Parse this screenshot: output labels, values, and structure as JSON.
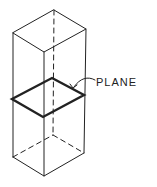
{
  "diagram": {
    "label": "PLANE",
    "colors": {
      "line": "#222222",
      "background": "#ffffff"
    },
    "prism": {
      "top_face": [
        [
          54,
          10
        ],
        [
          86,
          29
        ],
        [
          44,
          52
        ],
        [
          13,
          33
        ]
      ],
      "bottom_face": [
        [
          53,
          135
        ],
        [
          84,
          153
        ],
        [
          44,
          176
        ],
        [
          13,
          157
        ]
      ],
      "hidden_edges": "dashed"
    },
    "plane": [
      [
        52,
        78
      ],
      [
        84,
        95
      ],
      [
        43,
        117
      ],
      [
        12,
        99
      ]
    ]
  }
}
